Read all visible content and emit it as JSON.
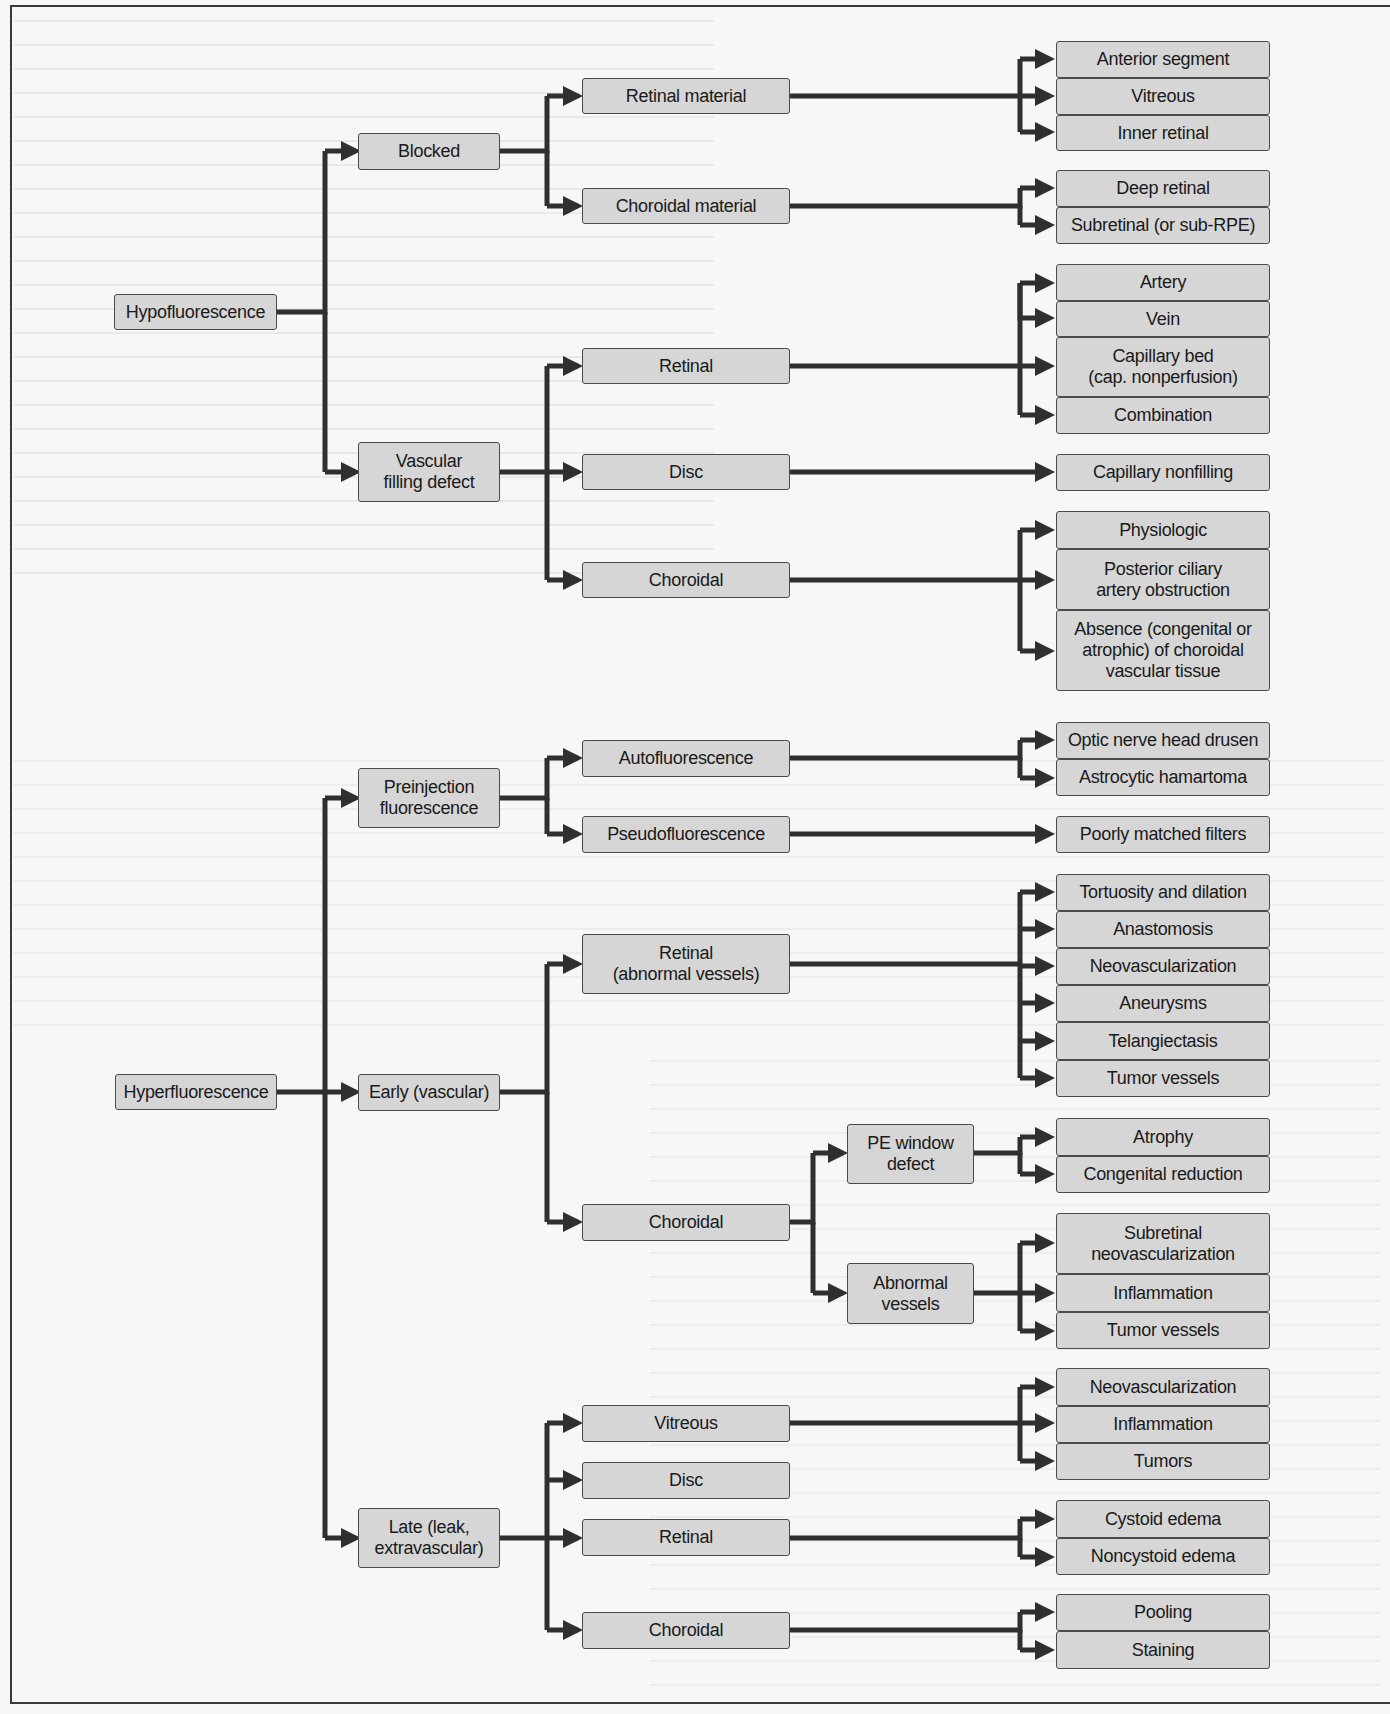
{
  "diagram": {
    "type": "tree-flowchart",
    "colors": {
      "box_fill": "#d6d6d6",
      "box_border": "#4a4a4a",
      "line": "#2f2f2f",
      "background": "#f7f7f5"
    },
    "hypofluorescence": {
      "root": "Hypofluorescence",
      "blocked": {
        "label": "Blocked",
        "retinal_material": {
          "label": "Retinal material",
          "children": [
            "Anterior segment",
            "Vitreous",
            "Inner retinal"
          ]
        },
        "choroidal_material": {
          "label": "Choroidal material",
          "children": [
            "Deep retinal",
            "Subretinal (or sub-RPE)"
          ]
        }
      },
      "vascular_filling_defect": {
        "label": "Vascular\nfilling defect",
        "retinal": {
          "label": "Retinal",
          "children": [
            "Artery",
            "Vein",
            "Capillary bed\n(cap. nonperfusion)",
            "Combination"
          ]
        },
        "disc": {
          "label": "Disc",
          "children": [
            "Capillary nonfilling"
          ]
        },
        "choroidal": {
          "label": "Choroidal",
          "children": [
            "Physiologic",
            "Posterior ciliary\nartery obstruction",
            "Absence (congenital or\natrophic) of choroidal\nvascular tissue"
          ]
        }
      }
    },
    "hyperfluorescence": {
      "root": "Hyperfluorescence",
      "preinjection": {
        "label": "Preinjection\nfluorescence",
        "autofluorescence": {
          "label": "Autofluorescence",
          "children": [
            "Optic nerve head drusen",
            "Astrocytic hamartoma"
          ]
        },
        "pseudofluorescence": {
          "label": "Pseudofluorescence",
          "children": [
            "Poorly matched filters"
          ]
        }
      },
      "early": {
        "label": "Early (vascular)",
        "retinal": {
          "label": "Retinal\n(abnormal vessels)",
          "children": [
            "Tortuosity and dilation",
            "Anastomosis",
            "Neovascularization",
            "Aneurysms",
            "Telangiectasis",
            "Tumor vessels"
          ]
        },
        "choroidal": {
          "label": "Choroidal",
          "pe_window_defect": {
            "label": "PE window\ndefect",
            "children": [
              "Atrophy",
              "Congenital reduction"
            ]
          },
          "abnormal_vessels": {
            "label": "Abnormal\nvessels",
            "children": [
              "Subretinal\nneovascularization",
              "Inflammation",
              "Tumor vessels"
            ]
          }
        }
      },
      "late": {
        "label": "Late (leak,\nextravascular)",
        "vitreous": {
          "label": "Vitreous",
          "children": [
            "Neovascularization",
            "Inflammation",
            "Tumors"
          ]
        },
        "disc": {
          "label": "Disc",
          "children": []
        },
        "retinal": {
          "label": "Retinal",
          "children": [
            "Cystoid edema",
            "Noncystoid edema"
          ]
        },
        "choroidal": {
          "label": "Choroidal",
          "children": [
            "Pooling",
            "Staining"
          ]
        }
      }
    }
  }
}
